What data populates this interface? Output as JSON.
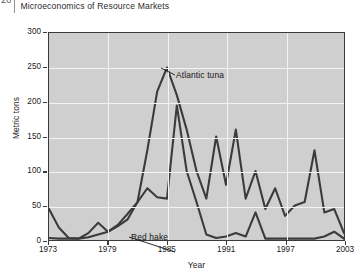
{
  "running_head": {
    "page_number": "20",
    "title": "Microeconomics of Resource Markets"
  },
  "chart_data": {
    "type": "line",
    "title": "",
    "xlabel": "Year",
    "ylabel": "Metric tons",
    "xlim": [
      1973,
      2003
    ],
    "ylim": [
      0,
      300
    ],
    "xticks": [
      "1973",
      "1979",
      "1985",
      "1991",
      "1997",
      "2003"
    ],
    "xtick_values": [
      1973,
      1979,
      1985,
      1991,
      1997,
      2003
    ],
    "yticks": [
      "0",
      "50",
      "100",
      "150",
      "200",
      "250",
      "300"
    ],
    "ytick_values": [
      0,
      50,
      100,
      150,
      200,
      250,
      300
    ],
    "grid": true,
    "grid_color": "#f2f2f2",
    "plot_background": "#cfcfcf",
    "line_color": "#3b3b3b",
    "legend": "inline-annotations",
    "x": [
      1973,
      1974,
      1975,
      1976,
      1977,
      1978,
      1979,
      1980,
      1981,
      1982,
      1983,
      1984,
      1985,
      1986,
      1987,
      1988,
      1989,
      1990,
      1991,
      1992,
      1993,
      1994,
      1995,
      1996,
      1997,
      1998,
      1999,
      2000,
      2001,
      2002,
      2003
    ],
    "series": [
      {
        "name": "Atlantic tuna",
        "label_position": "above-peak",
        "values": [
          3,
          2,
          2,
          2,
          4,
          8,
          12,
          20,
          30,
          55,
          130,
          215,
          250,
          210,
          160,
          100,
          60,
          150,
          80,
          160,
          60,
          100,
          45,
          75,
          35,
          50,
          55,
          130,
          40,
          45,
          10
        ]
      },
      {
        "name": "Red hake",
        "label_position": "below-curve",
        "values": [
          45,
          18,
          3,
          2,
          10,
          25,
          12,
          22,
          38,
          55,
          75,
          62,
          60,
          195,
          100,
          55,
          8,
          3,
          5,
          10,
          5,
          40,
          2,
          2,
          2,
          2,
          2,
          2,
          5,
          12,
          2
        ]
      }
    ]
  }
}
